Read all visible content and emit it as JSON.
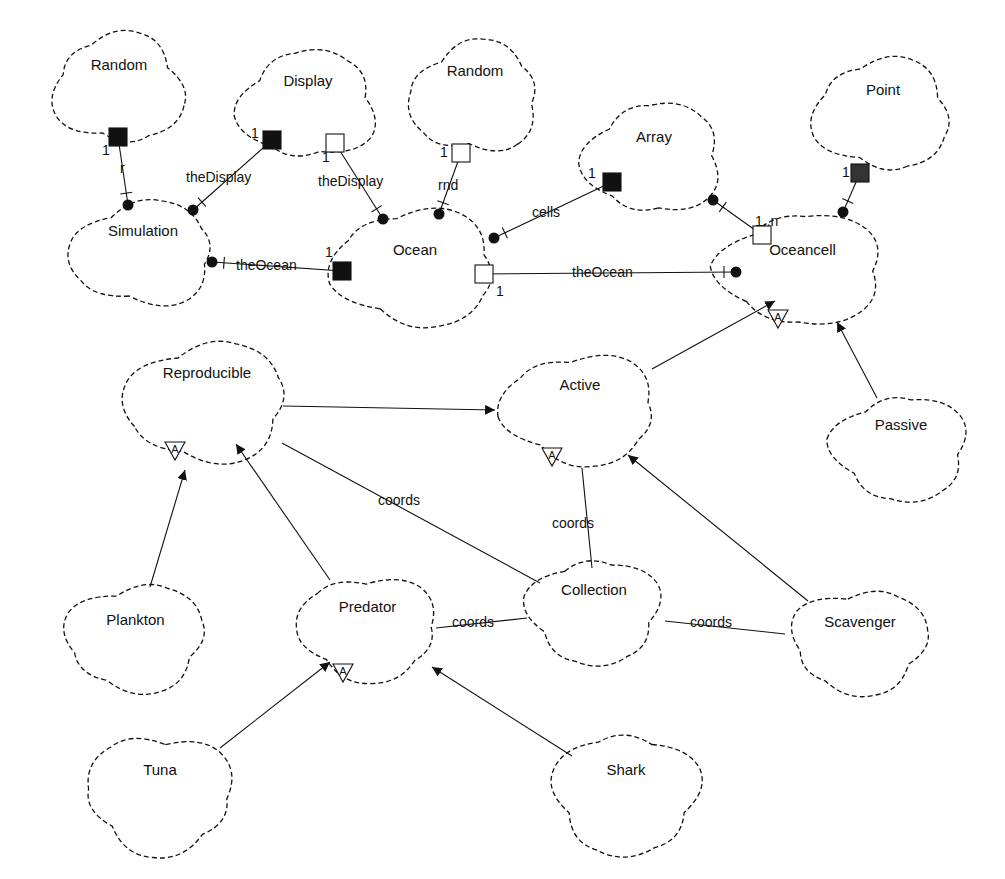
{
  "diagram": {
    "type": "Booch class diagram",
    "classes": [
      {
        "id": "random1",
        "name": "Random",
        "x": 48,
        "y": 30,
        "w": 142,
        "h": 118,
        "label_dy": 30
      },
      {
        "id": "display",
        "name": "Display",
        "x": 232,
        "y": 48,
        "w": 152,
        "h": 115,
        "label_dy": 28
      },
      {
        "id": "random2",
        "name": "Random",
        "x": 405,
        "y": 38,
        "w": 140,
        "h": 120,
        "label_dy": 28
      },
      {
        "id": "point",
        "name": "Point",
        "x": 808,
        "y": 55,
        "w": 150,
        "h": 120,
        "label_dy": 30
      },
      {
        "id": "array",
        "name": "Array",
        "x": 578,
        "y": 100,
        "w": 152,
        "h": 118,
        "label_dy": 32
      },
      {
        "id": "simulation",
        "name": "Simulation",
        "x": 64,
        "y": 198,
        "w": 158,
        "h": 112,
        "label_dy": 28
      },
      {
        "id": "ocean",
        "name": "Ocean",
        "x": 325,
        "y": 205,
        "w": 180,
        "h": 125,
        "label_dy": 40
      },
      {
        "id": "oceancell",
        "name": "Oceancell",
        "x": 710,
        "y": 210,
        "w": 185,
        "h": 118,
        "label_dy": 35
      },
      {
        "id": "reproducible",
        "name": "Reproducible",
        "x": 118,
        "y": 338,
        "w": 178,
        "h": 128,
        "label_dy": 30
      },
      {
        "id": "active",
        "name": "Active",
        "x": 495,
        "y": 350,
        "w": 170,
        "h": 118,
        "label_dy": 30
      },
      {
        "id": "passive",
        "name": "Passive",
        "x": 826,
        "y": 392,
        "w": 150,
        "h": 112,
        "label_dy": 28
      },
      {
        "id": "plankton",
        "name": "Plankton",
        "x": 58,
        "y": 580,
        "w": 155,
        "h": 115,
        "label_dy": 35
      },
      {
        "id": "predator",
        "name": "Predator",
        "x": 290,
        "y": 572,
        "w": 155,
        "h": 112,
        "label_dy": 30
      },
      {
        "id": "collection",
        "name": "Collection",
        "x": 520,
        "y": 555,
        "w": 148,
        "h": 112,
        "label_dy": 30
      },
      {
        "id": "scavenger",
        "name": "Scavenger",
        "x": 785,
        "y": 585,
        "w": 150,
        "h": 112,
        "label_dy": 32
      },
      {
        "id": "tuna",
        "name": "Tuna",
        "x": 80,
        "y": 730,
        "w": 160,
        "h": 128,
        "label_dy": 35
      },
      {
        "id": "shark",
        "name": "Shark",
        "x": 545,
        "y": 730,
        "w": 162,
        "h": 128,
        "label_dy": 35
      }
    ],
    "abstract_markers": [
      {
        "class": "oceancell",
        "x": 778,
        "y": 318,
        "label": "A"
      },
      {
        "class": "reproducible",
        "x": 175,
        "y": 450,
        "label": "A"
      },
      {
        "class": "active",
        "x": 552,
        "y": 456,
        "label": "A"
      },
      {
        "class": "predator",
        "x": 343,
        "y": 672,
        "label": "A"
      }
    ],
    "has_relationships": [
      {
        "from": "Simulation",
        "to": "Random",
        "role": "r",
        "mult": "1",
        "x1": 128,
        "y1": 205,
        "x2": 118,
        "y2": 137,
        "adorn": "filled",
        "role_x": 120,
        "role_y": 173,
        "mult_x": 102,
        "mult_y": 155
      },
      {
        "from": "Simulation",
        "to": "Display",
        "role": "theDisplay",
        "mult": "1",
        "x1": 193,
        "y1": 210,
        "x2": 272,
        "y2": 140,
        "adorn": "filled",
        "role_x": 186,
        "role_y": 182,
        "mult_x": 251,
        "mult_y": 138
      },
      {
        "from": "Simulation",
        "to": "Ocean",
        "role": "theOcean",
        "mult": "1",
        "x1": 212,
        "y1": 262,
        "x2": 342,
        "y2": 271,
        "adorn": "filled",
        "role_x": 236,
        "role_y": 270,
        "mult_x": 325,
        "mult_y": 257
      },
      {
        "from": "Ocean",
        "to": "Display",
        "role": "theDisplay",
        "mult": "1",
        "x1": 383,
        "y1": 219,
        "x2": 335,
        "y2": 143,
        "adorn": "open",
        "role_x": 318,
        "role_y": 186,
        "mult_x": 322,
        "mult_y": 162
      },
      {
        "from": "Ocean",
        "to": "Random",
        "role": "rnd",
        "mult": "1",
        "x1": 439,
        "y1": 214,
        "x2": 461,
        "y2": 153,
        "adorn": "open",
        "role_x": 438,
        "role_y": 190,
        "mult_x": 440,
        "mult_y": 157
      },
      {
        "from": "Ocean",
        "to": "Array",
        "role": "cells",
        "mult": "1",
        "x1": 494,
        "y1": 238,
        "x2": 612,
        "y2": 182,
        "adorn": "filled",
        "role_x": 532,
        "role_y": 217,
        "mult_x": 588,
        "mult_y": 178
      },
      {
        "from": "Oceancell",
        "to": "Ocean",
        "role": "theOcean",
        "mult": "1",
        "x1": 736,
        "y1": 272,
        "x2": 484,
        "y2": 274,
        "adorn": "open",
        "role_x": 572,
        "role_y": 277,
        "mult_x": 496,
        "mult_y": 296
      },
      {
        "from": "Array",
        "to": "Oceancell",
        "role": "",
        "mult": "1..n",
        "x1": 713,
        "y1": 200,
        "x2": 762,
        "y2": 235,
        "adorn": "open",
        "role_x": 0,
        "role_y": 0,
        "mult_x": 755,
        "mult_y": 226
      },
      {
        "from": "Oceancell",
        "to": "Point",
        "role": "",
        "mult": "1",
        "x1": 843,
        "y1": 212,
        "x2": 860,
        "y2": 173,
        "adorn": "filled-gray",
        "role_x": 0,
        "role_y": 0,
        "mult_x": 842,
        "mult_y": 177
      }
    ],
    "inheritance": [
      {
        "from": "Active",
        "to": "Oceancell",
        "x1": 652,
        "y1": 369,
        "x2": 775,
        "y2": 301
      },
      {
        "from": "Passive",
        "to": "Oceancell",
        "x1": 877,
        "y1": 398,
        "x2": 837,
        "y2": 322
      },
      {
        "from": "Reproducible",
        "to": "Active",
        "x1": 283,
        "y1": 406,
        "x2": 495,
        "y2": 410
      },
      {
        "from": "Plankton",
        "to": "Reproducible",
        "x1": 150,
        "y1": 587,
        "x2": 185,
        "y2": 470
      },
      {
        "from": "Predator",
        "to": "Reproducible",
        "x1": 330,
        "y1": 580,
        "x2": 236,
        "y2": 444
      },
      {
        "from": "Scavenger",
        "to": "Active",
        "x1": 808,
        "y1": 601,
        "x2": 628,
        "y2": 455
      },
      {
        "from": "Tuna",
        "to": "Predator",
        "x1": 220,
        "y1": 748,
        "x2": 330,
        "y2": 662
      },
      {
        "from": "Shark",
        "to": "Predator",
        "x1": 572,
        "y1": 756,
        "x2": 432,
        "y2": 667
      }
    ],
    "associations": [
      {
        "from": "Reproducible",
        "to": "Collection",
        "label": "coords",
        "x1": 282,
        "y1": 443,
        "x2": 540,
        "y2": 583,
        "lx": 378,
        "ly": 505
      },
      {
        "from": "Active",
        "to": "Collection",
        "label": "coords",
        "x1": 582,
        "y1": 468,
        "x2": 592,
        "y2": 568,
        "lx": 552,
        "ly": 528
      },
      {
        "from": "Predator",
        "to": "Collection",
        "label": "coords",
        "x1": 436,
        "y1": 628,
        "x2": 527,
        "y2": 618,
        "lx": 452,
        "ly": 627
      },
      {
        "from": "Collection",
        "to": "Scavenger",
        "label": "coords",
        "x1": 665,
        "y1": 621,
        "x2": 785,
        "y2": 634,
        "lx": 690,
        "ly": 627
      }
    ]
  }
}
